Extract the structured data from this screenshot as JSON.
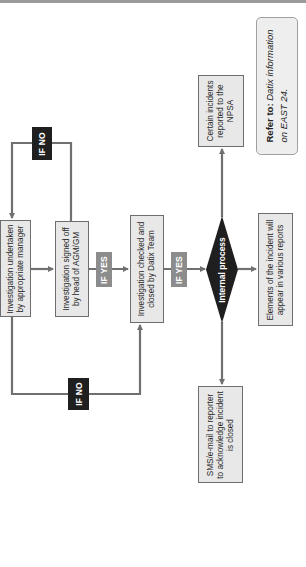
{
  "diagram": {
    "orientation": "rotated -90deg (text reads bottom-to-top)",
    "colors": {
      "box_fill": "#e8e8e8",
      "box_border": "#6e6e6e",
      "connector": "#707070",
      "if_no_label": "#1f1f1f",
      "if_yes_label": "#8c8c8c",
      "decision_fill": "#1f1f1f",
      "refer_fill": "#eeeeee"
    },
    "nodes": {
      "undertaken": {
        "line1": "Investigation undertaken",
        "line2": "by appropriate manager"
      },
      "signed_off": {
        "line1": "Investigation signed off",
        "line2": "by head of AGM/GM"
      },
      "checked": {
        "line1": "Investigation checked and",
        "line2": "closed by Datix Team"
      },
      "decision": {
        "label": "Internal process"
      },
      "npsa": {
        "line1": "Certain incidents",
        "line2": "reported to the",
        "line3": "NPSA"
      },
      "elements": {
        "line1": "Elements of the incident will",
        "line2": "appear in various reports"
      },
      "sms": {
        "line1": "SMS/e-mail to reporter",
        "line2": "to acknowledge incident",
        "line3": "is closed"
      }
    },
    "labels": {
      "if_no_top": "IF NO",
      "if_no_bottom": "IF NO",
      "if_yes_1": "IF YES",
      "if_yes_2": "IF YES"
    },
    "refer": {
      "bold": "Refer to:",
      "italic_1": "Datix information",
      "italic_2": "on EAST 24."
    }
  }
}
